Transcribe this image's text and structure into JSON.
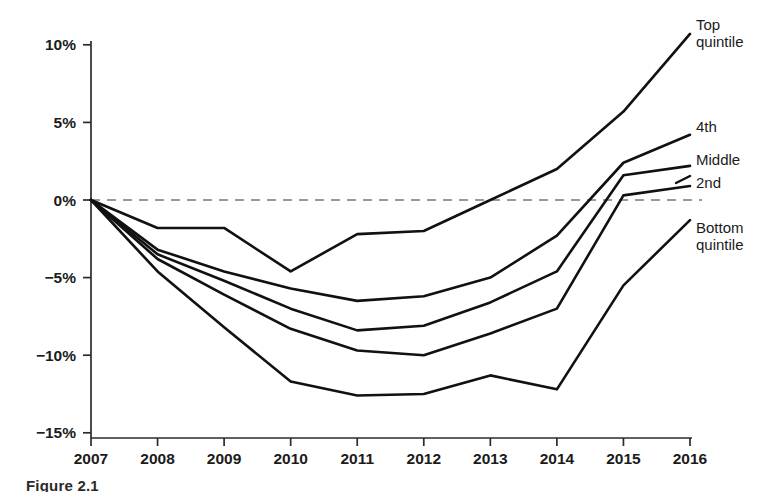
{
  "chart_data": {
    "type": "line",
    "title": "",
    "subtitle": "",
    "xlabel": "",
    "ylabel": "",
    "x": [
      2007,
      2008,
      2009,
      2010,
      2011,
      2012,
      2013,
      2014,
      2015,
      2016
    ],
    "categories": [
      "2007",
      "2008",
      "2009",
      "2010",
      "2011",
      "2012",
      "2013",
      "2014",
      "2015",
      "2016"
    ],
    "xlim": [
      2007,
      2016
    ],
    "ylim": [
      -15,
      10
    ],
    "y_ticks": [
      10,
      5,
      0,
      -5,
      -10,
      -15
    ],
    "y_tick_labels": [
      "10%",
      "5%",
      "0%",
      "−5%",
      "−10%",
      "−15%"
    ],
    "x_ticks": [
      2007,
      2008,
      2009,
      2010,
      2011,
      2012,
      2013,
      2014,
      2015,
      2016
    ],
    "x_tick_labels": [
      "2007",
      "2008",
      "2009",
      "2010",
      "2011",
      "2012",
      "2013",
      "2014",
      "2015",
      "2016"
    ],
    "grid": false,
    "legend_position": "right-inline-labels",
    "reference_line": {
      "value": 0,
      "style": "dashed",
      "color": "#9a9a9a"
    },
    "series": [
      {
        "name": "Top quintile",
        "label": "Top\nquintile",
        "label_line1": "Top",
        "label_line2": "quintile",
        "values": [
          0.0,
          -1.8,
          -1.8,
          -4.6,
          -2.2,
          -2.0,
          0.0,
          2.0,
          5.7,
          10.7
        ]
      },
      {
        "name": "4th",
        "label": "4th",
        "label_line1": "4th",
        "label_line2": "",
        "values": [
          0.0,
          -3.2,
          -4.6,
          -5.7,
          -6.5,
          -6.2,
          -5.0,
          -2.3,
          2.4,
          4.2
        ]
      },
      {
        "name": "Middle",
        "label": "Middle",
        "label_line1": "Middle",
        "label_line2": "",
        "values": [
          0.0,
          -3.5,
          -5.2,
          -7.0,
          -8.4,
          -8.1,
          -6.6,
          -4.6,
          1.6,
          2.2
        ]
      },
      {
        "name": "2nd",
        "label": "2nd",
        "label_line1": "2nd",
        "label_line2": "",
        "values": [
          0.0,
          -3.8,
          -6.1,
          -8.3,
          -9.7,
          -10.0,
          -8.6,
          -7.0,
          0.3,
          0.9
        ]
      },
      {
        "name": "Bottom quintile",
        "label": "Bottom\nquintile",
        "label_line1": "Bottom",
        "label_line2": "quintile",
        "values": [
          0.0,
          -4.6,
          -8.2,
          -11.7,
          -12.6,
          -12.5,
          -11.3,
          -12.2,
          -5.5,
          -1.3
        ]
      }
    ]
  },
  "caption": {
    "text": "Figure 2.1"
  },
  "colors": {
    "line": "#111111",
    "axis": "#2b2b2b",
    "reference": "#9a9a9a",
    "background": "#ffffff"
  }
}
